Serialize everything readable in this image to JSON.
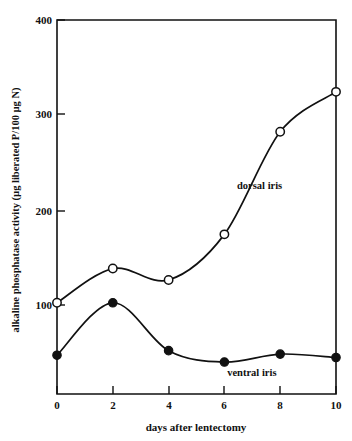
{
  "chart_data": {
    "type": "line",
    "title": "",
    "xlabel": "days after lentectomy",
    "ylabel": "alkaline phosphatase activity (µg liberated P/100 µg N)",
    "x": [
      0,
      2,
      4,
      6,
      8,
      10
    ],
    "xticks": [
      "0",
      "2",
      "4",
      "6",
      "8",
      "10"
    ],
    "yticks": [
      "100",
      "200",
      "300",
      "400"
    ],
    "ytick_values": [
      100,
      200,
      300,
      400
    ],
    "xlim": [
      0,
      10
    ],
    "ylim": [
      72,
      400
    ],
    "grid": "off",
    "legend_position": "inline-annotation",
    "series": [
      {
        "name": "dorsal iris",
        "marker": "open-circle",
        "values": [
          152,
          182,
          172,
          212,
          302,
          337
        ],
        "label_text": "dorsal iris"
      },
      {
        "name": "ventral iris",
        "marker": "filled-circle",
        "values": [
          106,
          152,
          110,
          100,
          107,
          104
        ],
        "label_text": "ventral iris"
      }
    ],
    "annotations": [
      {
        "text": "dorsal iris",
        "x": 6.45,
        "y": 252
      },
      {
        "text": "ventral iris",
        "x": 6.1,
        "y": 88
      }
    ],
    "colors": {
      "line": "#111111",
      "marker_open_fill": "#ffffff",
      "marker_filled_fill": "#111111",
      "axis": "#111111",
      "background": "#ffffff"
    }
  }
}
